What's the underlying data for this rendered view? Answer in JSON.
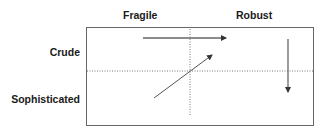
{
  "diagram": {
    "columns": [
      "Fragile",
      "Robust"
    ],
    "rows": [
      "Crude",
      "Sophisticated"
    ],
    "colors": {
      "frame": "#666666",
      "arrow": "#555555",
      "divider": "#777777"
    },
    "arrows": [
      {
        "name": "crude-fragile-to-robust",
        "from": [
          143,
          38
        ],
        "to": [
          226,
          38
        ]
      },
      {
        "name": "sophisticated-fragile-to-crude-robust",
        "from": [
          154,
          98
        ],
        "to": [
          212,
          55
        ]
      },
      {
        "name": "robust-crude-to-sophisticated",
        "from": [
          288,
          39
        ],
        "to": [
          288,
          92
        ]
      }
    ]
  }
}
